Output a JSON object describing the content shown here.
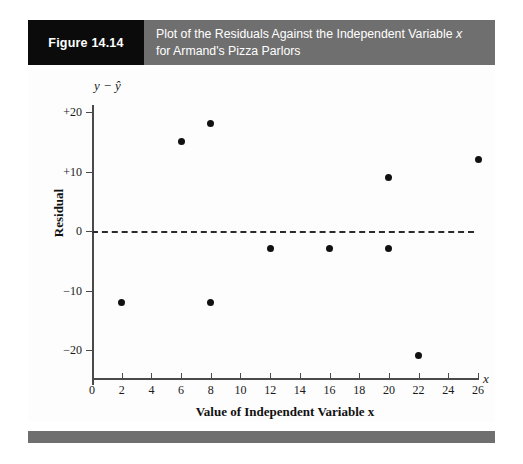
{
  "header": {
    "figure_tag": "Figure 14.14",
    "title_line_1_prefix": "Plot of the Residuals Against the Independent Variable ",
    "title_line_1_var": "x",
    "title_line_2": "for Armand's Pizza Parlors",
    "tag_background": "#0b0b0b",
    "bar_background": "#6f6f6f",
    "text_color": "#ffffff"
  },
  "chart_data": {
    "type": "scatter",
    "title": "Plot of the Residuals Against the Independent Variable x for Armand's Pizza Parlors",
    "xlabel": "Value of Independent Variable x",
    "ylabel": "Residual",
    "y_axis_symbol": "y − ŷ",
    "x_axis_symbol": "x",
    "xlim": [
      0,
      26
    ],
    "ylim": [
      -24,
      22
    ],
    "xticks": [
      0,
      2,
      4,
      6,
      8,
      10,
      12,
      14,
      16,
      18,
      20,
      22,
      24,
      26
    ],
    "xtick_labels": [
      "0",
      "2",
      "4",
      "6",
      "8",
      "10",
      "12",
      "14",
      "16",
      "18",
      "20",
      "22",
      "24",
      "26"
    ],
    "yticks": [
      20,
      10,
      0,
      -10,
      -20
    ],
    "ytick_labels": [
      "+20",
      "+10",
      "0",
      "−10",
      "−20"
    ],
    "grid": false,
    "legend": null,
    "reference_line": {
      "y": 0,
      "style": "dashed",
      "color": "#2b2b2b"
    },
    "point_color": "#111111",
    "x": [
      2,
      6,
      8,
      8,
      12,
      16,
      20,
      20,
      22,
      26
    ],
    "y": [
      -12,
      15,
      18,
      -12,
      -3,
      -3,
      9,
      -3,
      -21,
      12
    ],
    "points": [
      {
        "x": 2,
        "y": -12
      },
      {
        "x": 6,
        "y": 15
      },
      {
        "x": 8,
        "y": 18
      },
      {
        "x": 8,
        "y": -12
      },
      {
        "x": 12,
        "y": -3
      },
      {
        "x": 16,
        "y": -3
      },
      {
        "x": 20,
        "y": 9
      },
      {
        "x": 20,
        "y": -3
      },
      {
        "x": 22,
        "y": -21
      },
      {
        "x": 26,
        "y": 12
      }
    ]
  }
}
